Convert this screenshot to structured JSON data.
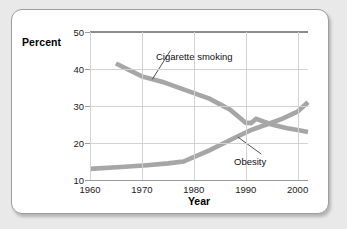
{
  "figure": {
    "axis_title_y": "Percent",
    "axis_title_x": "Year"
  },
  "chart_data": {
    "type": "line",
    "title": "",
    "subtitle": "",
    "xlabel": "Year",
    "ylabel": "Percent",
    "xlim": [
      1960,
      2002
    ],
    "ylim": [
      10,
      50
    ],
    "xticks": [
      1960,
      1970,
      1980,
      1990,
      2000
    ],
    "yticks": [
      10,
      20,
      30,
      40,
      50
    ],
    "xtick_labels": [
      "1960",
      "1970",
      "1980",
      "1990",
      "2000"
    ],
    "ytick_labels": [
      "10",
      "20",
      "30",
      "40",
      "50"
    ],
    "grid": true,
    "grid_axes": "both",
    "legend_position": "inline-annotations",
    "line_color": "#a6a6a6",
    "series": [
      {
        "name": "Cigarette smoking",
        "color": "#a6a6a6",
        "x": [
          1965,
          1970,
          1974,
          1978,
          1983,
          1987,
          1990,
          1991,
          1992,
          1995,
          1998,
          2000,
          2002
        ],
        "values": [
          41.5,
          38.0,
          36.5,
          34.5,
          32.0,
          29.0,
          25.5,
          25.4,
          26.5,
          25.0,
          24.0,
          23.5,
          23.0
        ]
      },
      {
        "name": "Obesity",
        "color": "#a6a6a6",
        "x": [
          1960,
          1966,
          1971,
          1975,
          1978,
          1983,
          1988,
          1991,
          1994,
          1997,
          2000,
          2002
        ],
        "values": [
          13.0,
          13.5,
          14.0,
          14.5,
          15.0,
          18.0,
          21.5,
          23.5,
          25.0,
          26.5,
          28.5,
          31.0
        ]
      }
    ],
    "annotations": [
      {
        "text": "Cigarette smoking",
        "series": "Cigarette smoking"
      },
      {
        "text": "Obesity",
        "series": "Obesity"
      }
    ]
  }
}
